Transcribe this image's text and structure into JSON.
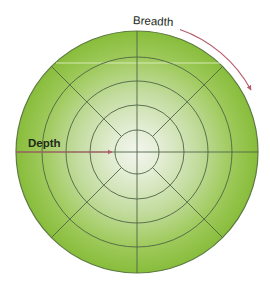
{
  "diagram": {
    "type": "concentric-circle-diagram",
    "labels": {
      "breadth": "Breadth",
      "depth": "Depth"
    },
    "geometry": {
      "center_x": 137,
      "center_y": 152,
      "outer_radius": 121,
      "ring_radii": [
        22,
        47,
        71,
        95,
        121
      ],
      "spoke_angles_deg": [
        0,
        45,
        90,
        135,
        180,
        225,
        270,
        315
      ],
      "breadth_arc_radius": 130
    },
    "colors": {
      "outer_green": "#8dc03f",
      "mid_green": "#b3d38a",
      "center_glow": "#f1f5ea",
      "ring_stroke": "#4f6446",
      "outer_stroke": "#5d7a40",
      "arrow": "#b65a6c",
      "highlight_line": "#d6eab8",
      "text": "#222a1a"
    }
  }
}
